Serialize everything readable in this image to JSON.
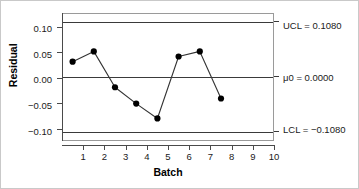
{
  "chart_data": {
    "type": "line",
    "title": "",
    "subtitle": "",
    "xlabel": "Batch",
    "ylabel": "Residual",
    "x": [
      1,
      2,
      3,
      4,
      5,
      6,
      7,
      8
    ],
    "values": [
      0.03,
      0.05,
      -0.02,
      -0.052,
      -0.081,
      0.04,
      0.05,
      -0.042
    ],
    "series": [
      {
        "name": "Residual",
        "values": [
          0.03,
          0.05,
          -0.02,
          -0.052,
          -0.081,
          0.04,
          0.05,
          -0.042
        ]
      }
    ],
    "xlim": [
      0.5,
      10.5
    ],
    "ylim": [
      -0.125,
      0.125
    ],
    "xticks": [
      1,
      2,
      3,
      4,
      5,
      6,
      7,
      8,
      9,
      10
    ],
    "xticklabels": [
      "1",
      "2",
      "3",
      "4",
      "5",
      "6",
      "7",
      "8",
      "9",
      "10"
    ],
    "yticks": [
      0.1,
      0.05,
      0.0,
      -0.05,
      -0.1
    ],
    "yticklabels": [
      "0.10",
      "0.05",
      "0.00",
      "−0.05",
      "−0.10"
    ],
    "grid": false,
    "legend": false,
    "marker": "filled-circle",
    "reference_lines": [
      {
        "name": "UCL",
        "value": 0.108,
        "label": "UCL = 0.1080"
      },
      {
        "name": "mu0",
        "value": 0.0,
        "label": "μ0 = 0.0000"
      },
      {
        "name": "LCL",
        "value": -0.108,
        "label": "LCL = −0.1080"
      }
    ],
    "colors": {
      "line": "#333333",
      "marker": "#000000",
      "reference_line": "#3a3a3a",
      "axis": "#4a4a4a",
      "frame": "#c9c9c9",
      "background": "#ffffff",
      "text": "#1a1a1a"
    }
  },
  "axes": {
    "y_title": "Residual",
    "x_title": "Batch",
    "y_tick_labels": [
      "0.10",
      "0.05",
      "0.00",
      "−0.05",
      "−0.10"
    ],
    "x_tick_labels": [
      "1",
      "2",
      "3",
      "4",
      "5",
      "6",
      "7",
      "8",
      "9",
      "10"
    ]
  },
  "limits": {
    "ucl_label": "UCL = 0.1080",
    "center_label": "μ0 = 0.0000",
    "lcl_label": "LCL = −0.1080"
  }
}
